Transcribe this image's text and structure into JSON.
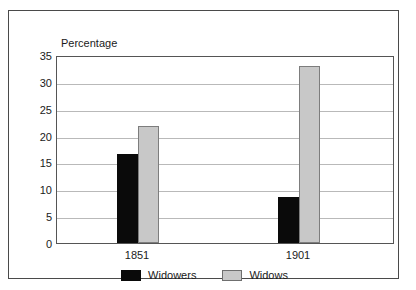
{
  "chart_data": {
    "type": "bar",
    "title": "",
    "subtitle": "",
    "xlabel": "",
    "ylabel": "Percentage",
    "ylim": [
      0,
      35
    ],
    "ytick_step": 5,
    "yticks": [
      35,
      30,
      25,
      20,
      15,
      10,
      5,
      0
    ],
    "grid": true,
    "legend_position": "bottom",
    "categories": [
      "1851",
      "1901"
    ],
    "series": [
      {
        "name": "Widowers",
        "color": "#0a0a0a",
        "values": [
          16.5,
          8.5
        ]
      },
      {
        "name": "Widows",
        "color": "#c8c8c8",
        "values": [
          21.8,
          33.0
        ]
      }
    ]
  },
  "axis": {
    "y_title": "Percentage",
    "ticks": [
      "35",
      "30",
      "25",
      "20",
      "15",
      "10",
      "5",
      "0"
    ],
    "x_labels": [
      "1851",
      "1901"
    ]
  },
  "legend": {
    "entries": [
      {
        "label": "Widowers",
        "swatch": "black-swatch"
      },
      {
        "label": "Widows",
        "swatch": "grey-swatch"
      }
    ]
  },
  "colors": {
    "widowers": "#0a0a0a",
    "widows": "#c8c8c8",
    "gridline": "#b9b9b9",
    "frame": "#4a4a4a",
    "axis": "#555555",
    "background": "#ffffff"
  }
}
